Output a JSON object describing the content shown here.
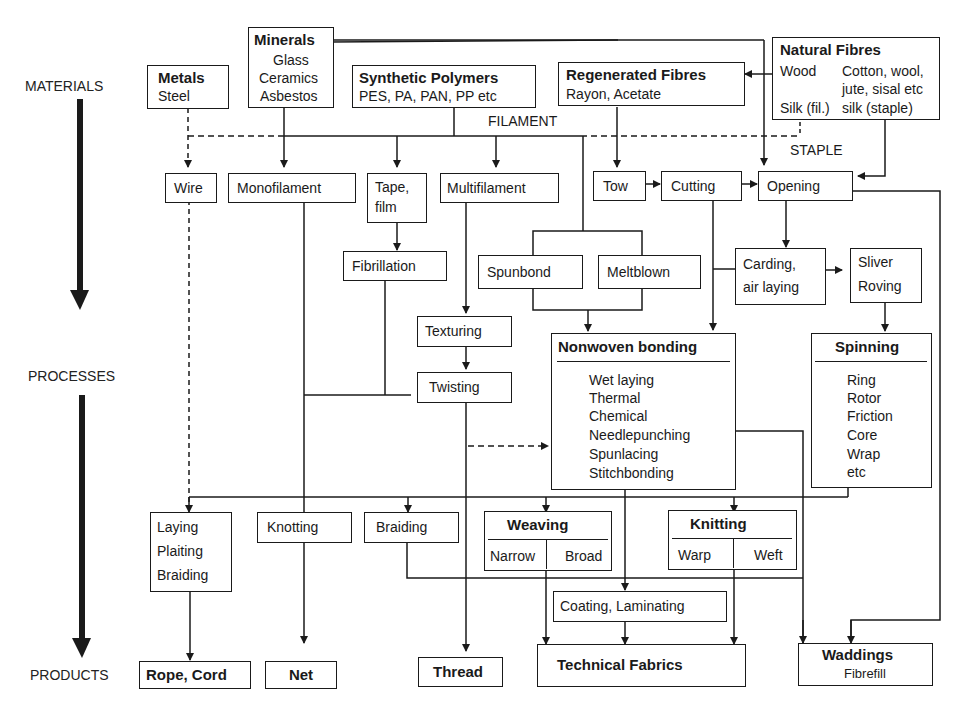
{
  "stages": {
    "materials": "MATERIALS",
    "processes": "PROCESSES",
    "products": "PRODUCTS"
  },
  "labels": {
    "filament": "FILAMENT",
    "staple": "STAPLE"
  },
  "materials": {
    "metals": {
      "title": "Metals",
      "items": "Steel"
    },
    "minerals": {
      "title": "Minerals",
      "items": [
        "Glass",
        "Ceramics",
        "Asbestos"
      ]
    },
    "synthetic": {
      "title": "Synthetic Polymers",
      "items": "PES, PA, PAN, PP etc"
    },
    "regenerated": {
      "title": "Regenerated Fibres",
      "items": "Rayon, Acetate"
    },
    "natural": {
      "title": "Natural Fibres",
      "wood": "Wood",
      "cotton": "Cotton, wool,",
      "jute": "jute, sisal etc",
      "silk_fil": "Silk (fil.)",
      "silk_staple": "silk (staple)"
    }
  },
  "processes": {
    "wire": "Wire",
    "monofilament": "Monofilament",
    "tape1": "Tape,",
    "tape2": "film",
    "multifilament": "Multifilament",
    "tow": "Tow",
    "cutting": "Cutting",
    "opening": "Opening",
    "fibrillation": "Fibrillation",
    "spunbond": "Spunbond",
    "meltblown": "Meltblown",
    "carding1": "Carding,",
    "carding2": "air laying",
    "sliver1": "Sliver",
    "sliver2": "Roving",
    "texturing": "Texturing",
    "twisting": "Twisting",
    "nonwoven": {
      "title": "Nonwoven bonding",
      "items": [
        "Wet laying",
        "Thermal",
        "Chemical",
        "Needlepunching",
        "Spunlacing",
        "Stitchbonding"
      ]
    },
    "spinning": {
      "title": "Spinning",
      "items": [
        "Ring",
        "Rotor",
        "Friction",
        "Core",
        "Wrap",
        "etc"
      ]
    },
    "laying": [
      "Laying",
      "Plaiting",
      "Braiding"
    ],
    "knotting": "Knotting",
    "braiding": "Braiding",
    "weaving": {
      "title": "Weaving",
      "left": "Narrow",
      "right": "Broad"
    },
    "knitting": {
      "title": "Knitting",
      "left": "Warp",
      "right": "Weft"
    },
    "coating": "Coating, Laminating"
  },
  "products": {
    "rope": "Rope, Cord",
    "net": "Net",
    "thread": "Thread",
    "technical": "Technical Fabrics",
    "waddings": {
      "title": "Waddings",
      "sub": "Fibrefill"
    }
  }
}
